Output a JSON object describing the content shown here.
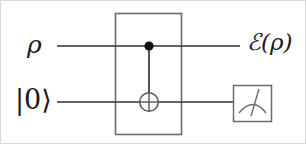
{
  "figure": {
    "kind": "quantum-circuit-diagram",
    "width": 306,
    "height": 144,
    "background_color": "#ffffff",
    "line_color": "#4a4a4a",
    "wire_color": "#333333",
    "ink_color": "#1a1a1a"
  },
  "labels": {
    "input_top": "ρ",
    "input_bottom": "|0⟩",
    "output_top": "ℰ(ρ)"
  },
  "wires": [
    {
      "name": "top-wire",
      "label": "ρ",
      "y": 45,
      "x_start": 56,
      "x_end": 239
    },
    {
      "name": "bottom-wire",
      "label": "|0⟩",
      "y": 101,
      "x_start": 56,
      "x_end": 232
    }
  ],
  "gate_box": {
    "name": "channel-box",
    "label": "",
    "x": 114,
    "y": 12,
    "width": 66,
    "height": 122
  },
  "cnot": {
    "control": {
      "x": 148,
      "y": 45,
      "radius": 4.5,
      "filled": true
    },
    "target": {
      "x": 148,
      "y": 101,
      "radius": 9.5
    },
    "connector": {
      "x": 148,
      "y_start": 45,
      "y_end": 101
    }
  },
  "meter": {
    "name": "measurement-meter",
    "x": 232,
    "y": 84,
    "width": 39,
    "height": 37,
    "needle_angle_deg": -18
  }
}
